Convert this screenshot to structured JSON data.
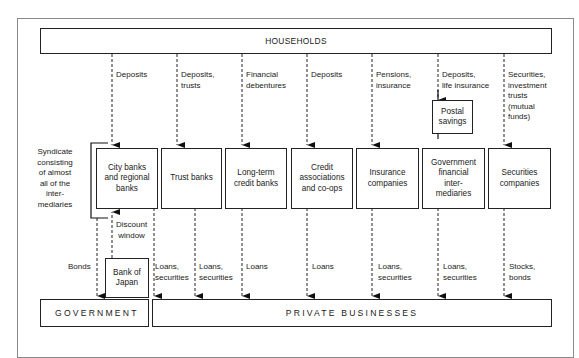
{
  "diagram": {
    "top_entity": "HOUSEHOLDS",
    "bottom_entities": {
      "government": "GOVERNMENT",
      "private": "PRIVATE BUSINESSES"
    },
    "syndicate_note": [
      "Syndicate",
      "consisting",
      "of almost",
      "all of the",
      "inter-",
      "mediaries"
    ],
    "intermediaries": [
      {
        "name": [
          "City banks",
          "and regional",
          "banks"
        ],
        "inflow": [
          "Deposits"
        ],
        "outflow": [
          "Loans,",
          "securities"
        ]
      },
      {
        "name": [
          "Trust banks"
        ],
        "inflow": [
          "Deposits,",
          "trusts"
        ],
        "outflow": [
          "Loans,",
          "securities"
        ]
      },
      {
        "name": [
          "Long-term",
          "credit banks"
        ],
        "inflow": [
          "Financial",
          "debentures"
        ],
        "outflow": [
          "Loans"
        ]
      },
      {
        "name": [
          "Credit",
          "associations",
          "and co-ops"
        ],
        "inflow": [
          "Deposits"
        ],
        "outflow": [
          "Loans"
        ]
      },
      {
        "name": [
          "Insurance",
          "companies"
        ],
        "inflow": [
          "Pensions,",
          "insurance"
        ],
        "outflow": [
          "Loans,",
          "securities"
        ]
      },
      {
        "name": [
          "Government",
          "financial",
          "inter-",
          "mediaries"
        ],
        "inflow": [
          "Deposits,",
          "life insurance"
        ],
        "outflow": [
          "Loans,",
          "securities"
        ]
      },
      {
        "name": [
          "Securities",
          "companies"
        ],
        "inflow": [
          "Securities,",
          "investment",
          "trusts",
          "(mutual",
          "funds)"
        ],
        "outflow": [
          "Stocks,",
          "bonds"
        ]
      }
    ],
    "postal_savings": [
      "Postal",
      "savings"
    ],
    "bank_of_japan": [
      "Bank of",
      "Japan"
    ],
    "discount_window": [
      "Discount",
      "window"
    ],
    "bonds_label": "Bonds"
  }
}
